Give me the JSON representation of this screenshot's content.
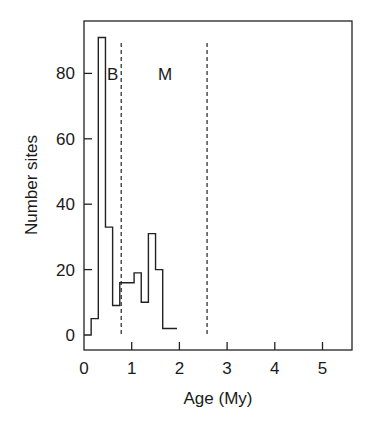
{
  "chart_data": {
    "type": "bar",
    "subtype": "step-histogram",
    "title": "",
    "xlabel": "Age (My)",
    "ylabel": "Number sites",
    "xlim": [
      0,
      5.6
    ],
    "ylim": [
      -3,
      95
    ],
    "xticks": [
      0,
      1,
      2,
      3,
      4,
      5
    ],
    "xtick_labels": [
      "0",
      "1",
      "2",
      "3",
      "4",
      "5"
    ],
    "yticks": [
      0,
      20,
      40,
      60,
      80
    ],
    "ytick_labels": [
      "0",
      "20",
      "40",
      "60",
      "80"
    ],
    "grid": false,
    "legend": null,
    "bin_width": 0.15,
    "bin_edges": [
      0.0,
      0.15,
      0.3,
      0.45,
      0.6,
      0.75,
      0.9,
      1.05,
      1.2,
      1.35,
      1.5,
      1.65,
      1.8,
      1.95
    ],
    "values": [
      0,
      5,
      91,
      33,
      9,
      16,
      16,
      19,
      10,
      31,
      20,
      2,
      2
    ],
    "reference_lines": [
      {
        "x": 0.78,
        "style": "dashed"
      },
      {
        "x": 2.58,
        "style": "dashed"
      }
    ],
    "annotations": [
      {
        "text": "B",
        "x": 0.6,
        "y": 80
      },
      {
        "text": "M",
        "x": 1.7,
        "y": 80
      }
    ]
  }
}
